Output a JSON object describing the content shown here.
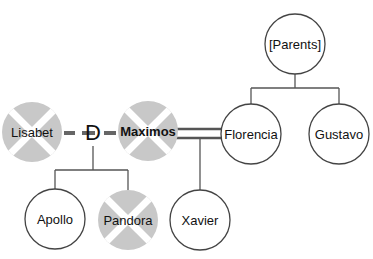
{
  "diagram": {
    "type": "family-tree",
    "colors": {
      "line": "#555555",
      "deceased_fill": "#c8c8c8",
      "living_fill": "#ffffff",
      "relation_line": "#666666"
    },
    "people": {
      "parents": {
        "label": "[Parents]",
        "status": "placeholder"
      },
      "lisabet": {
        "label": "Lisabet",
        "status": "deceased"
      },
      "maximos": {
        "label": "Maximos",
        "status": "deceased",
        "focus": true
      },
      "florencia": {
        "label": "Florencia",
        "status": "living"
      },
      "gustavo": {
        "label": "Gustavo",
        "status": "living"
      },
      "apollo": {
        "label": "Apollo",
        "status": "living"
      },
      "pandora": {
        "label": "Pandora",
        "status": "deceased"
      },
      "xavier": {
        "label": "Xavier",
        "status": "living"
      }
    },
    "relations": {
      "divorce_marker": "D",
      "lisabet_maximos": "divorced",
      "maximos_florencia": "married"
    }
  }
}
